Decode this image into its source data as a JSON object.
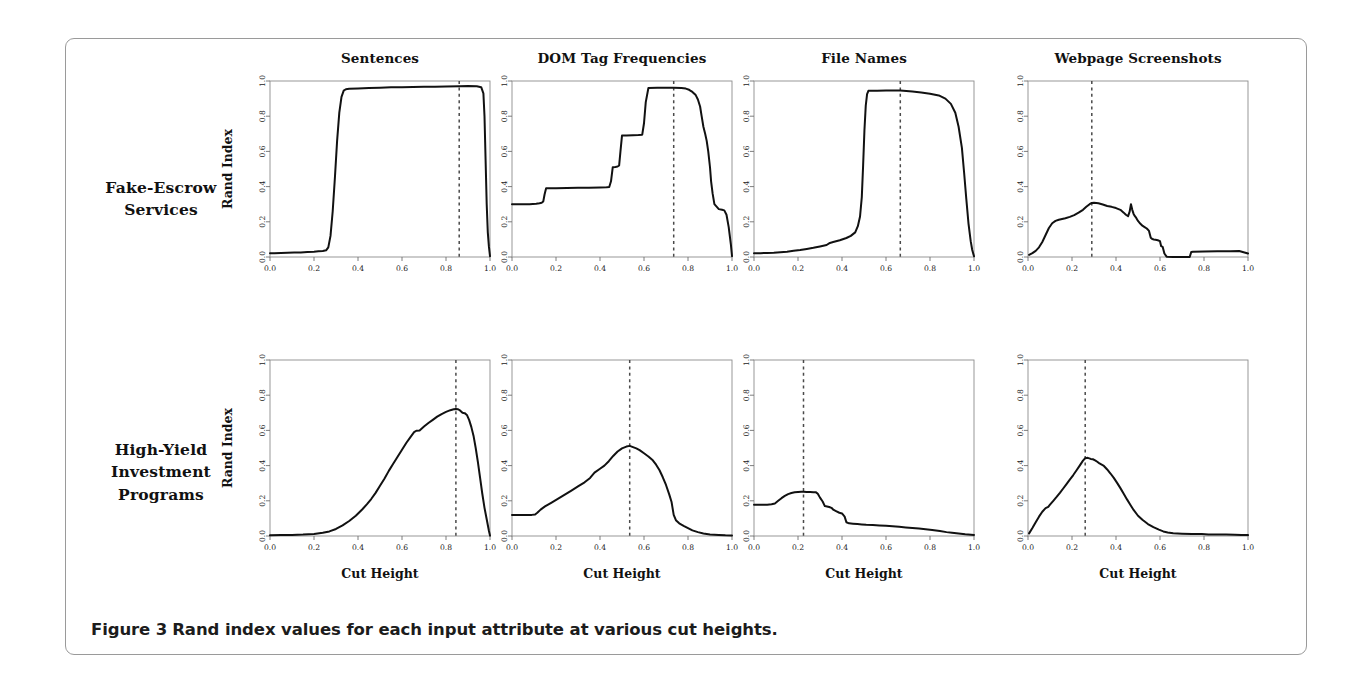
{
  "figure": {
    "caption_label": "Figure 3",
    "caption_text": "Rand index values for each input attribute at various cut heights.",
    "row_labels": [
      "Fake-Escrow Services",
      "High-Yield Investment Programs"
    ],
    "column_titles": [
      "Sentences",
      "DOM Tag Frequencies",
      "File Names",
      "Webpage Screenshots"
    ],
    "x_axis_label": "Cut Height",
    "y_axis_label": "Rand Index",
    "tick_labels": [
      "0.0",
      "0.2",
      "0.4",
      "0.6",
      "0.8",
      "1.0"
    ],
    "tick_values": [
      0.0,
      0.2,
      0.4,
      0.6,
      0.8,
      1.0
    ],
    "curve_color": "#111111",
    "cutline_color": "#4a4a4a",
    "box_color": "#8d8d8d",
    "frame_color": "#9a9a9a"
  },
  "chart_data": [
    {
      "type": "line",
      "title": "Sentences",
      "row": "Fake-Escrow Services",
      "xlabel": "Cut Height",
      "ylabel": "Rand Index",
      "xlim": [
        0.0,
        1.0
      ],
      "ylim": [
        0.0,
        1.0
      ],
      "grid": false,
      "cut_height_marker": 0.86,
      "x": [
        0.0,
        0.02,
        0.05,
        0.08,
        0.11,
        0.14,
        0.17,
        0.2,
        0.22,
        0.24,
        0.255,
        0.265,
        0.275,
        0.285,
        0.295,
        0.305,
        0.315,
        0.325,
        0.335,
        0.345,
        0.36,
        0.4,
        0.45,
        0.5,
        0.55,
        0.6,
        0.65,
        0.7,
        0.75,
        0.8,
        0.86,
        0.9,
        0.94,
        0.96,
        0.97,
        0.975,
        0.98,
        0.985,
        0.99,
        0.995,
        1.0
      ],
      "y": [
        0.022,
        0.022,
        0.023,
        0.024,
        0.025,
        0.026,
        0.028,
        0.03,
        0.032,
        0.034,
        0.038,
        0.055,
        0.12,
        0.26,
        0.45,
        0.66,
        0.82,
        0.91,
        0.945,
        0.953,
        0.956,
        0.958,
        0.96,
        0.962,
        0.964,
        0.965,
        0.966,
        0.967,
        0.968,
        0.969,
        0.97,
        0.971,
        0.97,
        0.965,
        0.93,
        0.8,
        0.55,
        0.3,
        0.14,
        0.06,
        0.005
      ]
    },
    {
      "type": "line",
      "title": "DOM Tag Frequencies",
      "row": "Fake-Escrow Services",
      "xlabel": "Cut Height",
      "ylabel": "Rand Index",
      "xlim": [
        0.0,
        1.0
      ],
      "ylim": [
        0.0,
        1.0
      ],
      "grid": false,
      "cut_height_marker": 0.735,
      "x": [
        0.0,
        0.04,
        0.08,
        0.11,
        0.125,
        0.135,
        0.142,
        0.148,
        0.155,
        0.2,
        0.25,
        0.3,
        0.35,
        0.4,
        0.43,
        0.442,
        0.45,
        0.458,
        0.47,
        0.48,
        0.487,
        0.493,
        0.5,
        0.52,
        0.55,
        0.575,
        0.592,
        0.6,
        0.608,
        0.62,
        0.66,
        0.7,
        0.735,
        0.77,
        0.79,
        0.805,
        0.82,
        0.835,
        0.845,
        0.855,
        0.862,
        0.87,
        0.878,
        0.885,
        0.892,
        0.9,
        0.905,
        0.912,
        0.92,
        0.94,
        0.955,
        0.965,
        0.975,
        0.985,
        0.995,
        1.0
      ],
      "y": [
        0.3,
        0.3,
        0.3,
        0.302,
        0.305,
        0.308,
        0.315,
        0.355,
        0.39,
        0.391,
        0.392,
        0.393,
        0.394,
        0.395,
        0.396,
        0.398,
        0.43,
        0.51,
        0.512,
        0.514,
        0.52,
        0.6,
        0.69,
        0.691,
        0.692,
        0.693,
        0.695,
        0.76,
        0.88,
        0.96,
        0.961,
        0.962,
        0.962,
        0.96,
        0.957,
        0.95,
        0.938,
        0.92,
        0.895,
        0.855,
        0.8,
        0.74,
        0.7,
        0.66,
        0.6,
        0.51,
        0.43,
        0.36,
        0.3,
        0.272,
        0.268,
        0.265,
        0.24,
        0.17,
        0.07,
        0.005
      ]
    },
    {
      "type": "line",
      "title": "File Names",
      "row": "Fake-Escrow Services",
      "xlabel": "Cut Height",
      "ylabel": "Rand Index",
      "xlim": [
        0.0,
        1.0
      ],
      "ylim": [
        0.0,
        1.0
      ],
      "grid": false,
      "cut_height_marker": 0.665,
      "x": [
        0.0,
        0.03,
        0.06,
        0.09,
        0.12,
        0.15,
        0.18,
        0.21,
        0.24,
        0.27,
        0.3,
        0.33,
        0.345,
        0.36,
        0.39,
        0.42,
        0.44,
        0.46,
        0.472,
        0.482,
        0.49,
        0.496,
        0.502,
        0.508,
        0.514,
        0.52,
        0.528,
        0.56,
        0.6,
        0.665,
        0.72,
        0.76,
        0.8,
        0.84,
        0.87,
        0.895,
        0.915,
        0.93,
        0.945,
        0.955,
        0.965,
        0.975,
        0.985,
        0.992,
        1.0
      ],
      "y": [
        0.022,
        0.022,
        0.023,
        0.024,
        0.027,
        0.03,
        0.035,
        0.04,
        0.046,
        0.052,
        0.06,
        0.068,
        0.08,
        0.085,
        0.095,
        0.108,
        0.12,
        0.14,
        0.175,
        0.23,
        0.34,
        0.52,
        0.72,
        0.86,
        0.925,
        0.944,
        0.945,
        0.945,
        0.946,
        0.946,
        0.94,
        0.935,
        0.928,
        0.918,
        0.9,
        0.87,
        0.82,
        0.74,
        0.62,
        0.48,
        0.33,
        0.19,
        0.09,
        0.04,
        0.004
      ]
    },
    {
      "type": "line",
      "title": "Webpage Screenshots",
      "row": "Fake-Escrow Services",
      "xlabel": "Cut Height",
      "ylabel": "Rand Index",
      "xlim": [
        0.0,
        1.0
      ],
      "ylim": [
        0.0,
        1.0
      ],
      "grid": false,
      "cut_height_marker": 0.29,
      "x": [
        0.005,
        0.02,
        0.035,
        0.05,
        0.065,
        0.08,
        0.095,
        0.11,
        0.125,
        0.14,
        0.155,
        0.17,
        0.19,
        0.21,
        0.23,
        0.25,
        0.265,
        0.28,
        0.29,
        0.3,
        0.32,
        0.34,
        0.36,
        0.38,
        0.4,
        0.42,
        0.435,
        0.445,
        0.455,
        0.462,
        0.468,
        0.474,
        0.48,
        0.486,
        0.492,
        0.5,
        0.51,
        0.52,
        0.53,
        0.54,
        0.55,
        0.558,
        0.565,
        0.572,
        0.58,
        0.59,
        0.6,
        0.605,
        0.612,
        0.62,
        0.63,
        0.66,
        0.7,
        0.735,
        0.742,
        0.75,
        0.8,
        0.86,
        0.92,
        0.96,
        1.0
      ],
      "y": [
        0.012,
        0.022,
        0.035,
        0.055,
        0.085,
        0.125,
        0.165,
        0.192,
        0.205,
        0.212,
        0.216,
        0.22,
        0.228,
        0.238,
        0.252,
        0.268,
        0.285,
        0.3,
        0.307,
        0.308,
        0.305,
        0.298,
        0.29,
        0.285,
        0.278,
        0.268,
        0.252,
        0.24,
        0.232,
        0.258,
        0.3,
        0.268,
        0.245,
        0.232,
        0.222,
        0.205,
        0.19,
        0.178,
        0.17,
        0.162,
        0.148,
        0.11,
        0.102,
        0.1,
        0.098,
        0.095,
        0.09,
        0.062,
        0.058,
        0.02,
        0.002,
        0.0,
        0.0,
        0.0,
        0.028,
        0.03,
        0.031,
        0.032,
        0.033,
        0.034,
        0.02
      ]
    },
    {
      "type": "line",
      "title": "Sentences",
      "row": "High-Yield Investment Programs",
      "xlabel": "Cut Height",
      "ylabel": "Rand Index",
      "xlim": [
        0.0,
        1.0
      ],
      "ylim": [
        0.0,
        1.0
      ],
      "grid": false,
      "cut_height_marker": 0.845,
      "x": [
        0.0,
        0.05,
        0.1,
        0.15,
        0.2,
        0.24,
        0.27,
        0.3,
        0.33,
        0.36,
        0.39,
        0.42,
        0.44,
        0.46,
        0.48,
        0.5,
        0.52,
        0.54,
        0.56,
        0.58,
        0.6,
        0.62,
        0.64,
        0.655,
        0.665,
        0.68,
        0.7,
        0.72,
        0.74,
        0.76,
        0.78,
        0.8,
        0.82,
        0.835,
        0.845,
        0.855,
        0.865,
        0.875,
        0.885,
        0.895,
        0.905,
        0.915,
        0.925,
        0.935,
        0.945,
        0.955,
        0.965,
        0.975,
        0.985,
        0.995,
        1.0
      ],
      "y": [
        0.004,
        0.005,
        0.006,
        0.008,
        0.012,
        0.018,
        0.026,
        0.04,
        0.06,
        0.085,
        0.115,
        0.152,
        0.18,
        0.21,
        0.245,
        0.285,
        0.325,
        0.37,
        0.41,
        0.45,
        0.49,
        0.53,
        0.565,
        0.59,
        0.598,
        0.6,
        0.622,
        0.642,
        0.66,
        0.678,
        0.693,
        0.705,
        0.715,
        0.72,
        0.722,
        0.72,
        0.712,
        0.7,
        0.698,
        0.688,
        0.66,
        0.62,
        0.57,
        0.5,
        0.42,
        0.33,
        0.24,
        0.16,
        0.095,
        0.03,
        0.002
      ]
    },
    {
      "type": "line",
      "title": "DOM Tag Frequencies",
      "row": "High-Yield Investment Programs",
      "xlabel": "Cut Height",
      "ylabel": "Rand Index",
      "xlim": [
        0.0,
        1.0
      ],
      "ylim": [
        0.0,
        1.0
      ],
      "grid": false,
      "cut_height_marker": 0.535,
      "x": [
        0.0,
        0.03,
        0.06,
        0.09,
        0.105,
        0.115,
        0.13,
        0.15,
        0.18,
        0.21,
        0.24,
        0.27,
        0.3,
        0.33,
        0.355,
        0.375,
        0.4,
        0.42,
        0.44,
        0.46,
        0.48,
        0.5,
        0.52,
        0.535,
        0.55,
        0.565,
        0.58,
        0.6,
        0.62,
        0.64,
        0.655,
        0.67,
        0.685,
        0.7,
        0.715,
        0.725,
        0.735,
        0.745,
        0.76,
        0.78,
        0.8,
        0.82,
        0.845,
        0.87,
        0.9,
        0.94,
        0.97,
        1.0
      ],
      "y": [
        0.12,
        0.12,
        0.12,
        0.12,
        0.122,
        0.132,
        0.15,
        0.168,
        0.19,
        0.212,
        0.235,
        0.258,
        0.282,
        0.305,
        0.33,
        0.36,
        0.382,
        0.4,
        0.425,
        0.455,
        0.48,
        0.498,
        0.508,
        0.512,
        0.505,
        0.498,
        0.488,
        0.47,
        0.452,
        0.43,
        0.405,
        0.375,
        0.335,
        0.29,
        0.235,
        0.195,
        0.12,
        0.09,
        0.072,
        0.058,
        0.045,
        0.032,
        0.022,
        0.014,
        0.009,
        0.006,
        0.004,
        0.003
      ]
    },
    {
      "type": "line",
      "title": "File Names",
      "row": "High-Yield Investment Programs",
      "xlabel": "Cut Height",
      "ylabel": "Rand Index",
      "xlim": [
        0.0,
        1.0
      ],
      "ylim": [
        0.0,
        1.0
      ],
      "grid": false,
      "cut_height_marker": 0.225,
      "x": [
        0.0,
        0.02,
        0.04,
        0.06,
        0.08,
        0.095,
        0.11,
        0.125,
        0.14,
        0.155,
        0.17,
        0.185,
        0.2,
        0.215,
        0.225,
        0.24,
        0.255,
        0.27,
        0.282,
        0.29,
        0.3,
        0.312,
        0.322,
        0.332,
        0.342,
        0.352,
        0.362,
        0.375,
        0.388,
        0.4,
        0.412,
        0.42,
        0.432,
        0.45,
        0.47,
        0.49,
        0.51,
        0.54,
        0.57,
        0.6,
        0.63,
        0.66,
        0.69,
        0.72,
        0.75,
        0.78,
        0.81,
        0.845,
        0.875,
        0.9,
        0.93,
        0.96,
        1.0
      ],
      "y": [
        0.178,
        0.178,
        0.178,
        0.178,
        0.18,
        0.185,
        0.2,
        0.215,
        0.228,
        0.238,
        0.244,
        0.248,
        0.25,
        0.252,
        0.252,
        0.25,
        0.25,
        0.249,
        0.248,
        0.24,
        0.218,
        0.196,
        0.17,
        0.168,
        0.165,
        0.16,
        0.148,
        0.14,
        0.132,
        0.128,
        0.11,
        0.078,
        0.072,
        0.07,
        0.068,
        0.066,
        0.064,
        0.062,
        0.06,
        0.058,
        0.055,
        0.052,
        0.049,
        0.046,
        0.042,
        0.038,
        0.034,
        0.028,
        0.022,
        0.018,
        0.014,
        0.01,
        0.006
      ]
    },
    {
      "type": "line",
      "title": "Webpage Screenshots",
      "row": "High-Yield Investment Programs",
      "xlabel": "Cut Height",
      "ylabel": "Rand Index",
      "xlim": [
        0.0,
        1.0
      ],
      "ylim": [
        0.0,
        1.0
      ],
      "grid": false,
      "cut_height_marker": 0.26,
      "x": [
        0.005,
        0.02,
        0.035,
        0.05,
        0.065,
        0.08,
        0.092,
        0.1,
        0.115,
        0.13,
        0.145,
        0.16,
        0.175,
        0.19,
        0.205,
        0.22,
        0.235,
        0.25,
        0.26,
        0.272,
        0.285,
        0.295,
        0.305,
        0.315,
        0.325,
        0.335,
        0.345,
        0.36,
        0.375,
        0.39,
        0.405,
        0.42,
        0.435,
        0.45,
        0.465,
        0.48,
        0.5,
        0.52,
        0.545,
        0.57,
        0.595,
        0.615,
        0.635,
        0.66,
        0.7,
        0.745,
        0.79,
        0.82,
        0.86,
        0.9,
        0.94,
        0.97,
        1.0
      ],
      "y": [
        0.015,
        0.045,
        0.078,
        0.11,
        0.138,
        0.158,
        0.165,
        0.178,
        0.2,
        0.222,
        0.245,
        0.27,
        0.295,
        0.32,
        0.345,
        0.372,
        0.4,
        0.428,
        0.442,
        0.444,
        0.438,
        0.436,
        0.43,
        0.422,
        0.412,
        0.405,
        0.398,
        0.378,
        0.355,
        0.33,
        0.302,
        0.272,
        0.24,
        0.208,
        0.178,
        0.148,
        0.115,
        0.092,
        0.068,
        0.05,
        0.036,
        0.026,
        0.02,
        0.015,
        0.013,
        0.012,
        0.012,
        0.008,
        0.008,
        0.008,
        0.007,
        0.006,
        0.005
      ]
    }
  ]
}
